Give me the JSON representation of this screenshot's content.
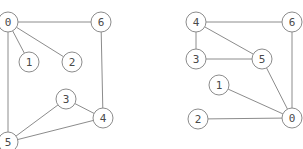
{
  "figure": {
    "background_color": "#ffffff",
    "edge_color": "#8c8c8c",
    "node_fill_color": "#ffffff",
    "node_stroke_color": "#8c8c8c",
    "label_color": "#4a4a4a",
    "node_radius": 10,
    "stroke_width": 1
  },
  "graphs": [
    {
      "id": "graph-left",
      "name": "left-graph",
      "nodes": [
        {
          "label": "0",
          "x": 8,
          "y": 22
        },
        {
          "label": "1",
          "x": 29,
          "y": 62
        },
        {
          "label": "2",
          "x": 72,
          "y": 62
        },
        {
          "label": "3",
          "x": 66,
          "y": 99
        },
        {
          "label": "4",
          "x": 103,
          "y": 118
        },
        {
          "label": "5",
          "x": 8,
          "y": 142
        },
        {
          "label": "6",
          "x": 101,
          "y": 22
        }
      ],
      "edges": [
        {
          "from": "0",
          "to": "6"
        },
        {
          "from": "0",
          "to": "1"
        },
        {
          "from": "0",
          "to": "2"
        },
        {
          "from": "0",
          "to": "5"
        },
        {
          "from": "6",
          "to": "4"
        },
        {
          "from": "3",
          "to": "4"
        },
        {
          "from": "3",
          "to": "5"
        },
        {
          "from": "5",
          "to": "4"
        }
      ]
    },
    {
      "id": "graph-right",
      "name": "right-graph",
      "nodes": [
        {
          "label": "4",
          "x": 196,
          "y": 22
        },
        {
          "label": "6",
          "x": 292,
          "y": 22
        },
        {
          "label": "3",
          "x": 196,
          "y": 59
        },
        {
          "label": "5",
          "x": 262,
          "y": 59
        },
        {
          "label": "1",
          "x": 219,
          "y": 85
        },
        {
          "label": "2",
          "x": 198,
          "y": 119
        },
        {
          "label": "0",
          "x": 292,
          "y": 118
        }
      ],
      "edges": [
        {
          "from": "4",
          "to": "6"
        },
        {
          "from": "4",
          "to": "3"
        },
        {
          "from": "4",
          "to": "5"
        },
        {
          "from": "3",
          "to": "5"
        },
        {
          "from": "5",
          "to": "0"
        },
        {
          "from": "6",
          "to": "0"
        },
        {
          "from": "1",
          "to": "0"
        },
        {
          "from": "2",
          "to": "0"
        }
      ]
    }
  ]
}
